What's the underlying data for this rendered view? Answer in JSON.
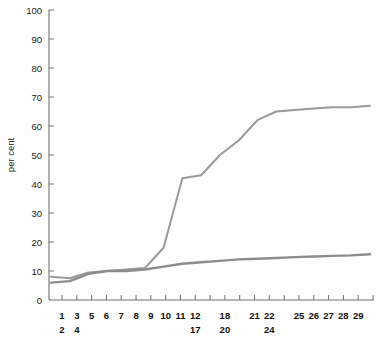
{
  "chart_data": {
    "type": "line",
    "title": "",
    "subtitle": "",
    "xlabel": "",
    "ylabel": "per cent",
    "ylim": [
      0,
      100
    ],
    "ytick_values": [
      0,
      10,
      20,
      30,
      40,
      50,
      60,
      70,
      80,
      90,
      100
    ],
    "ytick_labels": [
      "0",
      "10",
      "20",
      "30",
      "40",
      "50",
      "60",
      "70",
      "80",
      "90",
      "100"
    ],
    "grid": false,
    "legend": "none",
    "x_axis_tick_count": 22,
    "x_tick_labels_row1": [
      "1",
      "3",
      "5",
      "6",
      "7",
      "8",
      "9",
      "10",
      "11",
      "12",
      "18",
      "21",
      "22",
      "25",
      "26",
      "27",
      "28",
      "29"
    ],
    "x_tick_labels_row2": [
      "2",
      "4",
      "17",
      "20",
      "24"
    ],
    "x_tick_groups": [
      {
        "index": 0,
        "top": "1",
        "bottom": "2"
      },
      {
        "index": 1,
        "top": "3",
        "bottom": "4"
      },
      {
        "index": 2,
        "top": "5",
        "bottom": ""
      },
      {
        "index": 3,
        "top": "6",
        "bottom": ""
      },
      {
        "index": 4,
        "top": "7",
        "bottom": ""
      },
      {
        "index": 5,
        "top": "8",
        "bottom": ""
      },
      {
        "index": 6,
        "top": "9",
        "bottom": ""
      },
      {
        "index": 7,
        "top": "10",
        "bottom": ""
      },
      {
        "index": 8,
        "top": "11",
        "bottom": ""
      },
      {
        "index": 9,
        "top": "12",
        "bottom": "17"
      },
      {
        "index": 10,
        "top": "18",
        "bottom": "20"
      },
      {
        "index": 11,
        "top": "21",
        "bottom": ""
      },
      {
        "index": 12,
        "top": "22",
        "bottom": "24"
      },
      {
        "index": 13,
        "top": "25",
        "bottom": ""
      },
      {
        "index": 14,
        "top": "26",
        "bottom": ""
      },
      {
        "index": 15,
        "top": "27",
        "bottom": ""
      },
      {
        "index": 16,
        "top": "28",
        "bottom": ""
      },
      {
        "index": 17,
        "top": "29",
        "bottom": ""
      }
    ],
    "x": [
      0,
      1,
      2,
      3,
      4,
      5,
      6,
      7,
      8,
      9,
      10,
      11,
      12,
      13,
      14,
      15,
      16,
      17
    ],
    "series": [
      {
        "name": "upper",
        "color": "#9a9a9a",
        "width": 2.0,
        "values": [
          8,
          7.5,
          9.5,
          10,
          10.5,
          11,
          18,
          42,
          43,
          50,
          55,
          62,
          65,
          65.5,
          66,
          66.5,
          66.5,
          67
        ]
      },
      {
        "name": "lower",
        "color": "#8c8c8c",
        "width": 2.4,
        "values": [
          6,
          6.5,
          9,
          10,
          10,
          10.5,
          11.5,
          12.5,
          13,
          13.5,
          14,
          14.2,
          14.5,
          14.8,
          15,
          15.2,
          15.4,
          15.8
        ]
      }
    ]
  },
  "layout": {
    "plot_left": 49,
    "plot_right": 374,
    "plot_top": 10,
    "plot_bottom": 300,
    "tick_len": 5
  },
  "colors": {
    "background": "#fefefe",
    "axis": "#6e6e6e",
    "text": "#222222"
  }
}
